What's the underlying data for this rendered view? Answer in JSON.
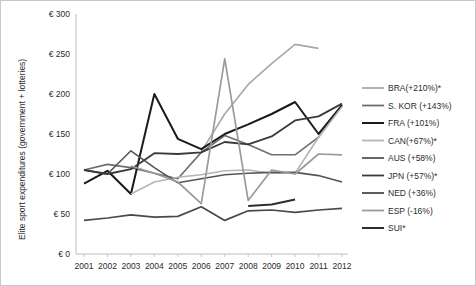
{
  "chart_data": {
    "type": "line",
    "title": "",
    "xlabel": "",
    "ylabel": "Elite sport expenditures (government + lotteries)",
    "categories": [
      "2001",
      "2002",
      "2003",
      "2004",
      "2005",
      "2006",
      "2007",
      "2008",
      "2009",
      "2010",
      "2011",
      "2012"
    ],
    "x": [
      2001,
      2002,
      2003,
      2004,
      2005,
      2006,
      2007,
      2008,
      2009,
      2010,
      2011,
      2012
    ],
    "ylim": [
      0,
      300
    ],
    "yticks": [
      0,
      50,
      100,
      150,
      200,
      250,
      300
    ],
    "ytick_labels": [
      "€ 0",
      "€ 50",
      "€ 100",
      "€ 150",
      "€ 200",
      "€ 250",
      "€ 300"
    ],
    "grid": false,
    "legend_position": "right",
    "currency_symbol": "€",
    "series": [
      {
        "name": "BRA(+210%)*",
        "short": "BRA",
        "change": "+210%",
        "color": "#a8a8a8",
        "width": 1.6,
        "values": [
          null,
          null,
          null,
          null,
          null,
          128,
          175,
          212,
          238,
          262,
          257,
          null
        ]
      },
      {
        "name": "S. KOR (+143%)",
        "short": "S. KOR",
        "change": "+143%",
        "color": "#6e6e6e",
        "width": 1.6,
        "values": [
          105,
          112,
          108,
          101,
          94,
          127,
          148,
          137,
          124,
          124,
          146,
          186
        ]
      },
      {
        "name": "FRA (+101%)",
        "short": "FRA",
        "change": "+101%",
        "color": "#1a1a1a",
        "width": 2.0,
        "values": [
          88,
          104,
          75,
          200,
          144,
          131,
          150,
          162,
          175,
          190,
          150,
          186
        ]
      },
      {
        "name": "CAN(+67%)*",
        "short": "CAN",
        "change": "+67%",
        "color": "#b5b5b5",
        "width": 1.6,
        "values": [
          null,
          null,
          75,
          90,
          96,
          99,
          104,
          105,
          101,
          101,
          146,
          184
        ]
      },
      {
        "name": "AUS (+58%)",
        "short": "AUS",
        "change": "+58%",
        "color": "#555555",
        "width": 1.6,
        "values": [
          105,
          100,
          129,
          108,
          89,
          94,
          99,
          101,
          102,
          102,
          98,
          90
        ]
      },
      {
        "name": "JPN (+57%)*",
        "short": "JPN",
        "change": "+57%",
        "color": "#3a3a3a",
        "width": 1.8,
        "values": [
          105,
          100,
          106,
          126,
          125,
          127,
          140,
          137,
          147,
          167,
          172,
          188
        ]
      },
      {
        "name": "NED (+36%)",
        "short": "NED",
        "change": "+36%",
        "color": "#4a4a4a",
        "width": 1.7,
        "values": [
          42,
          45,
          49,
          46,
          47,
          59,
          42,
          54,
          55,
          52,
          55,
          57
        ]
      },
      {
        "name": "ESP (-16%)",
        "short": "ESP",
        "change": "-16%",
        "color": "#9a9a9a",
        "width": 1.7,
        "values": [
          null,
          null,
          110,
          101,
          90,
          63,
          244,
          67,
          105,
          100,
          125,
          124
        ]
      },
      {
        "name": "SUI*",
        "short": "SUI",
        "change": "",
        "color": "#2e2e2e",
        "width": 2.0,
        "values": [
          null,
          null,
          null,
          null,
          null,
          null,
          null,
          60,
          62,
          68,
          null,
          null
        ]
      }
    ]
  },
  "legend": {
    "entries": [
      "BRA(+210%)*",
      "S. KOR (+143%)",
      "FRA (+101%)",
      "CAN(+67%)*",
      "AUS (+58%)",
      "JPN (+57%)*",
      "NED (+36%)",
      "ESP (-16%)",
      "SUI*"
    ]
  }
}
